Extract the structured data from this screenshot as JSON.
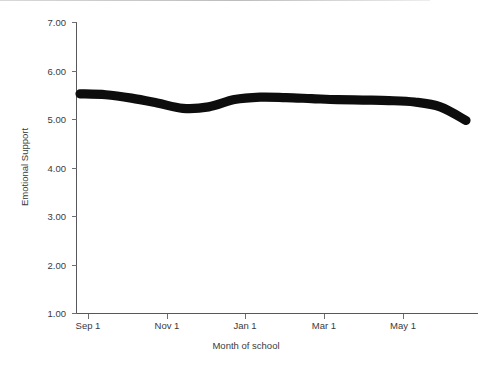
{
  "chart_data": {
    "type": "line",
    "title": "",
    "xlabel": "Month of school",
    "ylabel": "Emotional Support",
    "ylim": [
      1.0,
      7.0
    ],
    "xlim": [
      "Aug 15",
      "Jun 10"
    ],
    "grid": false,
    "legend": null,
    "y_ticks": [
      "7.00",
      "6.00",
      "5.00",
      "4.00",
      "3.00",
      "2.00",
      "1.00"
    ],
    "y_tick_values": [
      7.0,
      6.0,
      5.0,
      4.0,
      3.0,
      2.0,
      1.0
    ],
    "x_ticks": [
      "Sep 1",
      "Nov 1",
      "Jan 1",
      "Mar 1",
      "May 1"
    ],
    "series": [
      {
        "name": "Emotional Support",
        "color": "#0d0d0d",
        "line_width_px": 9,
        "x": [
          "Aug 20",
          "Sep 1",
          "Sep 20",
          "Oct 10",
          "Nov 1",
          "Nov 20",
          "Dec 10",
          "Jan 1",
          "Jan 20",
          "Feb 10",
          "Mar 1",
          "Mar 20",
          "Apr 10",
          "May 1",
          "May 20",
          "Jun 5"
        ],
        "values": [
          5.52,
          5.5,
          5.43,
          5.33,
          5.22,
          5.25,
          5.4,
          5.45,
          5.44,
          5.42,
          5.4,
          5.39,
          5.38,
          5.35,
          5.25,
          4.97
        ]
      }
    ]
  },
  "axis": {
    "y_label": "Emotional Support",
    "x_label": "Month of school",
    "y_tick_labels": [
      "7.00",
      "6.00",
      "5.00",
      "4.00",
      "3.00",
      "2.00",
      "1.00"
    ],
    "x_tick_labels": [
      "Sep 1",
      "Nov 1",
      "Jan 1",
      "Mar 1",
      "May 1"
    ]
  },
  "colors": {
    "line": "#0d0d0d",
    "axis": "#58585a",
    "text": "#3a3a3c",
    "background": "#ffffff"
  }
}
